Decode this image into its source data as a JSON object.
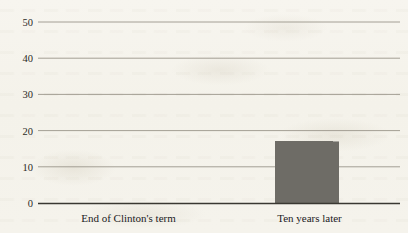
{
  "chart_data": {
    "type": "bar",
    "title": "",
    "subtitle": "",
    "xlabel": "",
    "ylabel": "",
    "categories": [
      "End of Clinton's term",
      "Ten years later"
    ],
    "values": [
      44,
      17
    ],
    "series": [
      {
        "name": "",
        "values": [
          44,
          17
        ]
      }
    ],
    "ylim": [
      0,
      50
    ],
    "yticks": [
      0,
      10,
      20,
      30,
      40,
      50
    ],
    "ytick_labels": [
      "0",
      "10",
      "20",
      "30",
      "40",
      "50"
    ],
    "grid": true,
    "grid_axis": "y",
    "legend": false,
    "legend_position": "none",
    "bar_color": "#6e6c66",
    "gridline_color": "#9a958a",
    "axis_color": "#3a3832",
    "background_color": "#f5f3ec",
    "text_color": "#22211e",
    "annotations": []
  },
  "axis": {
    "y": {
      "ticks": [
        {
          "value": 50,
          "label": "50"
        },
        {
          "value": 40,
          "label": "40"
        },
        {
          "value": 30,
          "label": "30"
        },
        {
          "value": 20,
          "label": "20"
        },
        {
          "value": 10,
          "label": "10"
        },
        {
          "value": 0,
          "label": "0"
        }
      ]
    },
    "x": {
      "ticks": [
        {
          "label": "End of Clinton's term"
        },
        {
          "label": "Ten years later"
        }
      ]
    }
  },
  "bars": [
    {
      "label": "End of Clinton's term",
      "value": 44
    },
    {
      "label": "Ten years later",
      "value": 17
    }
  ]
}
